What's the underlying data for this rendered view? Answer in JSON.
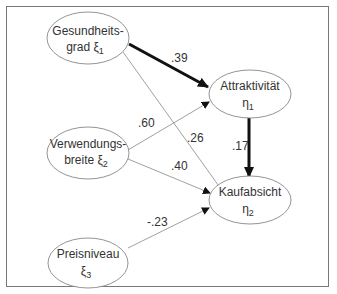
{
  "diagram": {
    "type": "structural-equation-model",
    "nodes": [
      {
        "id": "xi1",
        "line1": "Gesundheits-",
        "line2": "grad ξ",
        "sub": "1"
      },
      {
        "id": "xi2",
        "line1": "Verwendungs-",
        "line2": "breite ξ",
        "sub": "2"
      },
      {
        "id": "xi3",
        "line1": "Preisniveau",
        "line2": "ξ",
        "sub": "3"
      },
      {
        "id": "eta1",
        "line1": "Attraktivität",
        "line2": "η",
        "sub": "1"
      },
      {
        "id": "eta2",
        "line1": "Kaufabsicht",
        "line2": "η",
        "sub": "2"
      }
    ],
    "edges": [
      {
        "from": "xi1",
        "to": "eta1",
        "label": ".39",
        "bold": true
      },
      {
        "from": "xi1",
        "to": "eta2",
        "label": ".26",
        "bold": false
      },
      {
        "from": "xi2",
        "to": "eta1",
        "label": ".60",
        "bold": false
      },
      {
        "from": "xi2",
        "to": "eta2",
        "label": ".40",
        "bold": false
      },
      {
        "from": "xi3",
        "to": "eta2",
        "label": "-.23",
        "bold": false
      },
      {
        "from": "eta1",
        "to": "eta2",
        "label": ".17",
        "bold": true
      }
    ]
  }
}
